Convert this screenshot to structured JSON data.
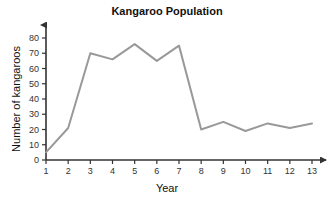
{
  "chart_data": {
    "type": "line",
    "title": "Kangaroo Population",
    "xlabel": "Year",
    "ylabel": "Number of kangaroos",
    "x": [
      1,
      2,
      3,
      4,
      5,
      6,
      7,
      8,
      9,
      10,
      11,
      12,
      13
    ],
    "values": [
      5,
      21,
      70,
      66,
      76,
      65,
      75,
      20,
      25,
      19,
      24,
      21,
      24
    ],
    "series": [
      {
        "name": "Kangaroo Population",
        "values": [
          5,
          21,
          70,
          66,
          76,
          65,
          75,
          20,
          25,
          19,
          24,
          21,
          24
        ]
      }
    ],
    "xtick_labels": [
      "1",
      "2",
      "3",
      "4",
      "5",
      "6",
      "7",
      "8",
      "9",
      "10",
      "11",
      "12",
      "13"
    ],
    "ytick_labels": [
      "0",
      "10",
      "20",
      "30",
      "40",
      "50",
      "60",
      "70",
      "80"
    ],
    "ytick_values": [
      0,
      10,
      20,
      30,
      40,
      50,
      60,
      70,
      80
    ],
    "xlim": [
      1,
      13
    ],
    "ylim": [
      0,
      80
    ],
    "grid": false,
    "legend": false,
    "line_color": "#999999",
    "axis_color": "#333333",
    "title_color": "#111111",
    "background_color": "#ffffff"
  }
}
